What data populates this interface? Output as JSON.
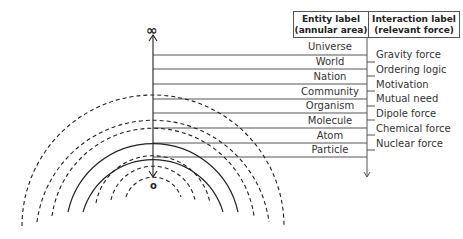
{
  "axis": {
    "top_symbol": "∞",
    "bottom_symbol": "o"
  },
  "header": {
    "entity_title": "Entity label",
    "entity_sub": "(annular area)",
    "interaction_title": "Interaction label",
    "interaction_sub": "(relevant force)"
  },
  "entities": [
    "Universe",
    "World",
    "Nation",
    "Community",
    "Organism",
    "Molecule",
    "Atom",
    "Particle"
  ],
  "forces": [
    "Gravity force",
    "Ordering logic",
    "Motivation",
    "Mutual need",
    "Dipole force",
    "Chemical force",
    "Nuclear force"
  ],
  "rings": [
    {
      "radius": 131,
      "style": "dashed"
    },
    {
      "radius": 117,
      "style": "dashed"
    },
    {
      "radius": 102,
      "style": "dashed"
    },
    {
      "radius": 87,
      "style": "solid"
    },
    {
      "radius": 73,
      "style": "solid"
    },
    {
      "radius": 58,
      "style": "dashed"
    },
    {
      "radius": 43,
      "style": "dashed"
    },
    {
      "radius": 29,
      "style": "dashed"
    }
  ]
}
